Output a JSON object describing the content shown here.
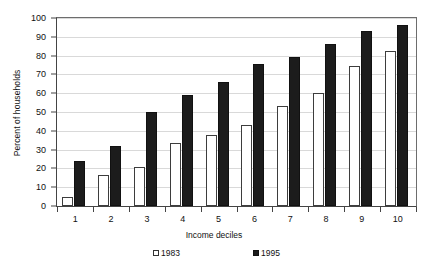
{
  "chart_data": {
    "type": "bar",
    "title": "",
    "xlabel": "Income deciles",
    "ylabel": "Percent of households",
    "ylim": [
      0,
      100
    ],
    "ytick_step": 10,
    "yticks": [
      0,
      10,
      20,
      30,
      40,
      50,
      60,
      70,
      80,
      90,
      100
    ],
    "grid": true,
    "legend_position": "bottom",
    "categories": [
      "1",
      "2",
      "3",
      "4",
      "5",
      "6",
      "7",
      "8",
      "9",
      "10"
    ],
    "series": [
      {
        "name": "1983",
        "color": "#ffffff",
        "edge_color": "#3d3d3d",
        "marker": "hollow-square",
        "values": [
          5,
          16.5,
          21,
          33.5,
          38,
          43.5,
          53.5,
          60.5,
          74.5,
          82.5
        ]
      },
      {
        "name": "1995",
        "color": "#1c1c1c",
        "edge_color": "#111111",
        "marker": "solid-square",
        "values": [
          24,
          32,
          50,
          59,
          66,
          75.5,
          79.5,
          86.5,
          93.5,
          96.5
        ]
      }
    ]
  },
  "legend": {
    "items": [
      {
        "label": "1983",
        "swatch": "hollow-square"
      },
      {
        "label": "1995",
        "swatch": "solid-square"
      }
    ]
  }
}
